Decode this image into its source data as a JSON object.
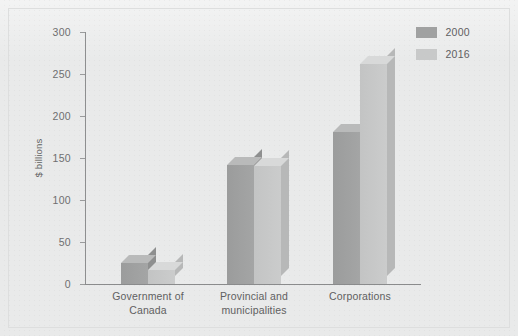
{
  "chart_data": {
    "type": "bar",
    "title": "",
    "subtitle": "",
    "xlabel": "",
    "ylabel": "$ billions",
    "ylim": [
      0,
      300
    ],
    "yticks": [
      0,
      50,
      100,
      150,
      200,
      250,
      300
    ],
    "ytick_labels": [
      "0",
      "50",
      "100",
      "150",
      "200",
      "250",
      "300"
    ],
    "grid": false,
    "style": "3d-grouped-bar",
    "legend_position": "top-right",
    "categories": [
      "Government of Canada",
      "Provincial and municipalities",
      "Corporations"
    ],
    "category_lines": [
      [
        "Government of",
        "Canada"
      ],
      [
        "Provincial and",
        "municipalities"
      ],
      [
        "Corporations"
      ]
    ],
    "series": [
      {
        "name": "2000",
        "color": "#a0a1a1",
        "values": [
          25,
          142,
          181
        ]
      },
      {
        "name": "2016",
        "color": "#c8c9c9",
        "values": [
          17,
          140,
          262
        ]
      }
    ]
  },
  "legend": {
    "items": [
      {
        "label": "2000",
        "swatch": "legend-swatch-2000"
      },
      {
        "label": "2016",
        "swatch": "legend-swatch-2016"
      }
    ]
  },
  "colors": {
    "background": "#e9eaea",
    "frame_border": "#dddede",
    "axis": "#8e8f90",
    "tick_text": "#6e6f70",
    "series_2000": "#a0a1a1",
    "series_2016": "#c8c9c9"
  }
}
